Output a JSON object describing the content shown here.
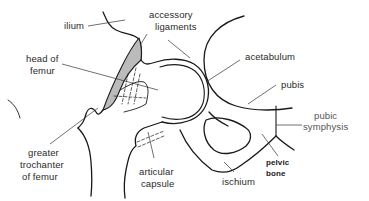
{
  "diagram": {
    "labels": {
      "ilium": "ilium",
      "accessory_ligaments_1": "accessory",
      "accessory_ligaments_2": "ligaments",
      "head_of_femur_1": "head of",
      "head_of_femur_2": "femur",
      "acetabulum": "acetabulum",
      "pubis": "pubis",
      "pubic_symphysis_1": "pubic",
      "pubic_symphysis_2": "symphysis",
      "greater_trochanter_1": "greater",
      "greater_trochanter_2": "trochanter",
      "greater_trochanter_3": "of femur",
      "articular_capsule_1": "articular",
      "articular_capsule_2": "capsule",
      "pelvic_bone_1": "pelvic",
      "pelvic_bone_2": "bone",
      "ischium": "ischium"
    },
    "colors": {
      "stroke": "#1a1a1a",
      "text": "#2a2a2a",
      "shading": "#555555",
      "background": "#ffffff"
    }
  }
}
